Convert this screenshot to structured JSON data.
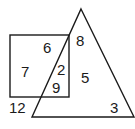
{
  "diagram": {
    "type": "venn-like",
    "shapes": [
      {
        "name": "square",
        "label": "square"
      },
      {
        "name": "triangle",
        "label": "triangle"
      }
    ],
    "regions": [
      {
        "id": "square-only-top",
        "value": "6"
      },
      {
        "id": "square-only-left",
        "value": "7"
      },
      {
        "id": "square-and-triangle-upper",
        "value": "2"
      },
      {
        "id": "square-and-triangle-lower",
        "value": "9"
      },
      {
        "id": "triangle-top",
        "value": "8"
      },
      {
        "id": "triangle-middle",
        "value": "5"
      },
      {
        "id": "triangle-bottom",
        "value": "3"
      },
      {
        "id": "outside",
        "value": "12"
      }
    ],
    "colors": {
      "stroke": "#1a1a1a",
      "background": "#ffffff"
    }
  }
}
